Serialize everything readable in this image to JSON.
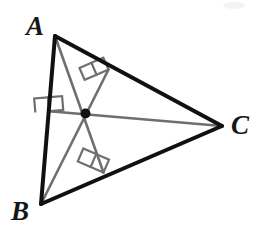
{
  "figure": {
    "kind": "geometry-diagram",
    "background_color": "#ffffff",
    "canvas": {
      "width": 264,
      "height": 241
    }
  },
  "style": {
    "triangle_stroke_color": "#111111",
    "triangle_stroke_width": 4,
    "altitude_stroke_color": "#6f6f6f",
    "altitude_stroke_width": 2.6,
    "right_angle_stroke_color": "#6f6f6f",
    "right_angle_stroke_width": 2.2,
    "orthocenter_fill_color": "#111111",
    "orthocenter_radius": 5,
    "label_color": "#161616"
  },
  "labels": {
    "vertex_a": "A",
    "vertex_b": "B",
    "vertex_c": "C"
  },
  "geometry": {
    "vertices": {
      "A": {
        "x": 55,
        "y": 36
      },
      "B": {
        "x": 41,
        "y": 204
      },
      "C": {
        "x": 222,
        "y": 126
      }
    },
    "orthocenter": {
      "x": 85.5,
      "y": 113.5
    },
    "altitude_feet": {
      "from_A_to_BC": {
        "x": 103.5,
        "y": 172.5
      },
      "from_B_to_AC": {
        "x": 108.5,
        "y": 69.5
      },
      "from_C_to_AB": {
        "x": 49.3,
        "y": 111.3
      }
    },
    "altitudes": [
      {
        "name": "altitude-from-A",
        "from": "A",
        "to": "foot-on-BC"
      },
      {
        "name": "altitude-from-B",
        "from": "B",
        "to": "foot-on-AC"
      },
      {
        "name": "altitude-from-C",
        "from": "C",
        "to": "foot-on-AB"
      }
    ],
    "right_angle_marks": [
      {
        "name": "right-angle-on-BC",
        "at": "foot-on-BC",
        "size": 13
      },
      {
        "name": "right-angle-on-AC",
        "at": "foot-on-AC",
        "size": 13
      },
      {
        "name": "right-angle-on-AB",
        "at": "foot-on-AB",
        "size": 13
      }
    ]
  }
}
